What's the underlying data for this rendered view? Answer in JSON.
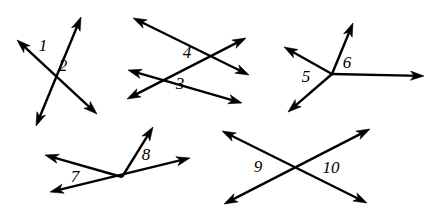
{
  "figure": {
    "width": 435,
    "height": 216,
    "background_color": "#ffffff",
    "stroke_color": "#000000",
    "stroke_width": 2.4,
    "label_color": "#000000"
  },
  "labels": [
    {
      "text": "1",
      "x": 43,
      "y": 45
    },
    {
      "text": "2",
      "x": 63,
      "y": 65
    },
    {
      "text": "4",
      "x": 187,
      "y": 52
    },
    {
      "text": "3",
      "x": 180,
      "y": 83
    },
    {
      "text": "5",
      "x": 306,
      "y": 76
    },
    {
      "text": "6",
      "x": 347,
      "y": 62
    },
    {
      "text": "7",
      "x": 75,
      "y": 176
    },
    {
      "text": "8",
      "x": 146,
      "y": 154
    },
    {
      "text": "9",
      "x": 258,
      "y": 166
    },
    {
      "text": "10",
      "x": 331,
      "y": 167
    }
  ],
  "groups": [
    {
      "name": "group-angles-1-2",
      "description": "Two lines crossing; angles 1 and 2 at the top of the intersection",
      "segments": [
        {
          "name": "segment-ne-sw",
          "x1": 81,
          "y1": 17,
          "x2": 36,
          "y2": 126,
          "arrow_start": true,
          "arrow_end": true
        },
        {
          "name": "segment-nw-se",
          "x1": 17,
          "y1": 40,
          "x2": 97,
          "y2": 114,
          "arrow_start": true,
          "arrow_end": true
        }
      ]
    },
    {
      "name": "group-angles-3-4",
      "description": "Two long lines crossing twice; angles 4 (upper) and 3 (lower)",
      "segments": [
        {
          "name": "segment-upper-nw-se",
          "x1": 133,
          "y1": 18,
          "x2": 249,
          "y2": 75,
          "arrow_start": true,
          "arrow_end": true
        },
        {
          "name": "segment-lower-nw-se",
          "x1": 128,
          "y1": 70,
          "x2": 242,
          "y2": 103,
          "arrow_start": true,
          "arrow_end": true
        },
        {
          "name": "segment-rising-sw-ne",
          "x1": 127,
          "y1": 99,
          "x2": 246,
          "y2": 38,
          "arrow_start": true,
          "arrow_end": true
        }
      ]
    },
    {
      "name": "group-angles-5-6",
      "description": "Four rays from a common vertex; angles 5 and 6",
      "vertex": {
        "x": 332,
        "y": 74
      },
      "segments": [
        {
          "name": "ray-up-left",
          "x1": 332,
          "y1": 74,
          "x2": 284,
          "y2": 47,
          "arrow_start": false,
          "arrow_end": true
        },
        {
          "name": "ray-up-right",
          "x1": 332,
          "y1": 74,
          "x2": 353,
          "y2": 23,
          "arrow_start": false,
          "arrow_end": true
        },
        {
          "name": "ray-right",
          "x1": 332,
          "y1": 74,
          "x2": 424,
          "y2": 76,
          "arrow_start": false,
          "arrow_end": true
        },
        {
          "name": "ray-down-left",
          "x1": 332,
          "y1": 74,
          "x2": 288,
          "y2": 112,
          "arrow_start": false,
          "arrow_end": true
        }
      ]
    },
    {
      "name": "group-angles-7-8",
      "description": "Rays from a common vertex with a line through it; angles 7 and 8",
      "vertex": {
        "x": 122,
        "y": 177
      },
      "segments": [
        {
          "name": "line-through-vertex",
          "x1": 50,
          "y1": 192,
          "x2": 190,
          "y2": 158,
          "arrow_start": true,
          "arrow_end": true
        },
        {
          "name": "ray-up-left",
          "x1": 122,
          "y1": 177,
          "x2": 45,
          "y2": 155,
          "arrow_start": false,
          "arrow_end": true
        },
        {
          "name": "ray-up-right",
          "x1": 122,
          "y1": 177,
          "x2": 153,
          "y2": 127,
          "arrow_start": false,
          "arrow_end": true
        }
      ]
    },
    {
      "name": "group-angles-9-10",
      "description": "Two lines crossing at a point forming left and right angles 9 and 10",
      "vertex": {
        "x": 295,
        "y": 167
      },
      "segments": [
        {
          "name": "segment-upper-left-to-lower-right",
          "x1": 222,
          "y1": 131,
          "x2": 367,
          "y2": 203,
          "arrow_start": true,
          "arrow_end": true
        },
        {
          "name": "segment-lower-left-to-upper-right",
          "x1": 224,
          "y1": 204,
          "x2": 370,
          "y2": 129,
          "arrow_start": true,
          "arrow_end": true
        }
      ]
    }
  ]
}
